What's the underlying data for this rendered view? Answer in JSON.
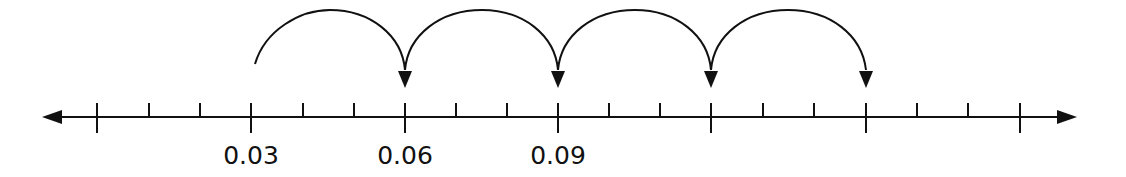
{
  "number_line": {
    "axis_y": 117,
    "x_start": 40,
    "x_end": 1080,
    "major_ticks": [
      {
        "x": 97,
        "value": 0.0,
        "label": ""
      },
      {
        "x": 251,
        "value": 0.03,
        "label": "0.03"
      },
      {
        "x": 405,
        "value": 0.06,
        "label": "0.06"
      },
      {
        "x": 558,
        "value": 0.09,
        "label": "0.09"
      },
      {
        "x": 711,
        "value": 0.12,
        "label": ""
      },
      {
        "x": 866,
        "value": 0.15,
        "label": ""
      },
      {
        "x": 1020,
        "value": 0.18,
        "label": ""
      }
    ],
    "minor_ticks_per_interval": 2,
    "line_color": "#111111"
  },
  "labels": {
    "l1": "0.03",
    "l2": "0.06",
    "l3": "0.09"
  },
  "jumps": [
    {
      "from": 0.03,
      "to": 0.06,
      "from_x": 251,
      "to_x": 405
    },
    {
      "from": 0.06,
      "to": 0.09,
      "from_x": 405,
      "to_x": 558
    },
    {
      "from": 0.09,
      "to": 0.12,
      "from_x": 558,
      "to_x": 711
    },
    {
      "from": 0.12,
      "to": 0.15,
      "from_x": 711,
      "to_x": 866
    }
  ],
  "jump_size": 0.03
}
